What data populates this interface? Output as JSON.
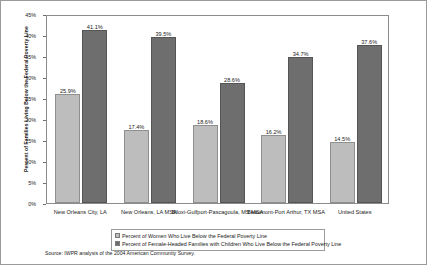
{
  "chart_data": {
    "type": "bar",
    "title": "",
    "xlabel": "",
    "ylabel": "Percent of Families Living Below the Federal Poverty Line",
    "ylim": [
      0,
      45
    ],
    "ytick_labels": [
      "0%",
      "5%",
      "10%",
      "15%",
      "20%",
      "25%",
      "30%",
      "35%",
      "40%",
      "45%"
    ],
    "ytick_values": [
      0,
      5,
      10,
      15,
      20,
      25,
      30,
      35,
      40,
      45
    ],
    "grid": false,
    "legend_position": "bottom",
    "categories": [
      "New Orleans City, LA",
      "New Orleans, LA MSA",
      "Biloxi-Gulfport-Pascagoula, MS MSA",
      "Beaumont-Port Arthur, TX MSA",
      "United States"
    ],
    "series": [
      {
        "name": "Percent of Women Who Live Below the Federal Poverty Line",
        "color": "#bdbdbd",
        "values": [
          25.9,
          17.4,
          18.6,
          16.2,
          14.5
        ],
        "labels": [
          "25.9%",
          "17.4%",
          "18.6%",
          "16.2%",
          "14.5%"
        ]
      },
      {
        "name": "Percent of Female-Headed Families with Children Who Live Below the Federal Poverty Line",
        "color": "#6e6e6e",
        "values": [
          41.1,
          39.5,
          28.6,
          34.7,
          37.6
        ],
        "labels": [
          "41.1%",
          "39.5%",
          "28.6%",
          "34.7%",
          "37.6%"
        ]
      }
    ],
    "source_note": "Source: IWPR analysis of the 2004 American Community Survey."
  }
}
